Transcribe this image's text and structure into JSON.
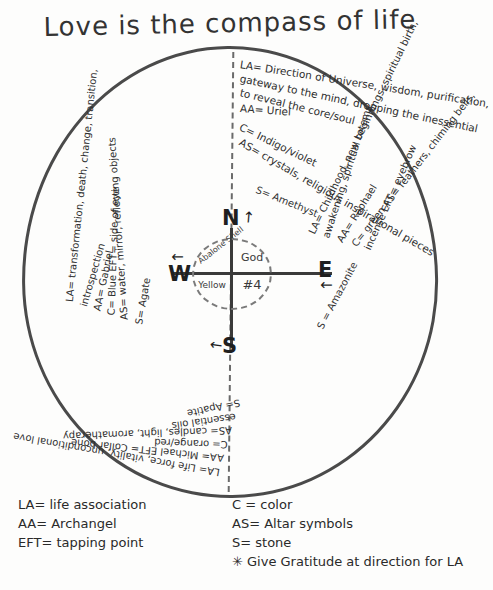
{
  "title": "Love is the compass of life",
  "center": {
    "top_left": "Abalone Shell",
    "top_right": "God",
    "bottom_left": "Yellow",
    "bottom_right": "#4"
  },
  "cardinals": {
    "north": "N",
    "south": "S",
    "west": "W",
    "east": "E"
  },
  "arrows": {
    "north": "↗",
    "south": "←",
    "west": "↑",
    "east": "↓"
  },
  "stone_callouts": {
    "north": "S= Amethyst",
    "east": "S = Amazonite"
  },
  "quadrants": {
    "north": {
      "direction": "North",
      "lines": [
        "LA= Direction of Universe, wisdom, purification,",
        "gateway to the mind, dropping the inessential",
        "to reveal the core/soul",
        "AA= Uriel",
        "C= Indigo/violet",
        "AS= crystals, religious inspirational pieces"
      ],
      "eft": "EFT= top of head"
    },
    "east": {
      "direction": "East",
      "lines": [
        "LA= Childhood, new beginnings, spiritual birth,",
        "awakening, spiritual totems",
        "AA= Raphael",
        "C= green    AS= feathers, chiming bells,",
        "incense    EFT= eyebrow"
      ]
    },
    "west": {
      "direction": "West",
      "lines": [
        "LA= transformation, death, change, transition,",
        "introspection",
        "AA= Gabriel",
        "C= Blue      EFT= side of eye",
        "AS= water, mirror, reflecting objects",
        "S= Agate"
      ]
    },
    "south": {
      "direction": "South",
      "lines": [
        "LA= Life force, vitality, unconditional love",
        "AA= Michael      EFT= Collar bone",
        "C= orange/red",
        "AS= candles, light, aromatherapy",
        "essential oils",
        "S= Apatite"
      ]
    }
  },
  "legend_left": [
    "LA= life association",
    "AA= Archangel",
    "EFT= tapping point"
  ],
  "legend_right": [
    "C = color",
    "AS= Altar symbols",
    "S= stone",
    "✳ Give Gratitude at direction for LA"
  ]
}
